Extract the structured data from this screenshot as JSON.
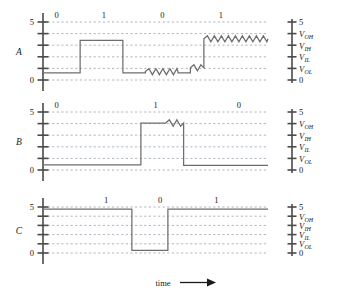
{
  "figure": {
    "caption_axis_label": "time",
    "time_arrow": "arrow-right"
  },
  "left_axis": {
    "top_label": "5",
    "bottom_label": "0",
    "tick_count": 6
  },
  "right_axis": {
    "labels": [
      {
        "text": "5",
        "type": "plain"
      },
      {
        "text": "V",
        "sub": "OH",
        "type": "voltage"
      },
      {
        "text": "V",
        "sub": "IH",
        "type": "voltage"
      },
      {
        "text": "V",
        "sub": "IL",
        "type": "voltage"
      },
      {
        "text": "V",
        "sub": "OL",
        "type": "voltage"
      },
      {
        "text": "0",
        "type": "plain"
      }
    ]
  },
  "rows": [
    {
      "name": "A",
      "label": "A",
      "description": "noisy signal with degraded levels",
      "bits": [
        "0",
        "1",
        "0",
        "1"
      ]
    },
    {
      "name": "B",
      "label": "B",
      "description": "partially restored signal",
      "bits": [
        "0",
        "1",
        "0"
      ]
    },
    {
      "name": "C",
      "label": "C",
      "description": "fully restored clean signal",
      "bits": [
        "1",
        "0",
        "1"
      ]
    }
  ],
  "chart_data": {
    "type": "line",
    "title": "",
    "xlabel": "time",
    "ylabel": "",
    "ylim": [
      0,
      5
    ],
    "grid": true,
    "legend": "none",
    "threshold_levels": [
      {
        "name": "5",
        "value": 5.0
      },
      {
        "name": "VOH",
        "value": 4.0
      },
      {
        "name": "VIH",
        "value": 3.0
      },
      {
        "name": "VIL",
        "value": 2.0
      },
      {
        "name": "VOL",
        "value": 1.0
      },
      {
        "name": "0",
        "value": 0.0
      }
    ],
    "series": [
      {
        "name": "A",
        "bit_labels": [
          "0",
          "1",
          "0",
          "1"
        ],
        "bit_label_x": [
          0.06,
          0.27,
          0.53,
          0.79
        ],
        "noise": "heavy",
        "segments": [
          {
            "bit": "0",
            "x0": 0.0,
            "x1": 0.165,
            "level": 0.62,
            "noise": "none"
          },
          {
            "bit": "1",
            "x0": 0.165,
            "x1": 0.355,
            "level": 3.42,
            "noise": "none"
          },
          {
            "bit": "0",
            "x0": 0.355,
            "x1": 0.455,
            "level": 0.62,
            "noise": "none"
          },
          {
            "bit": "0",
            "x0": 0.455,
            "x1": 0.6,
            "level": 0.72,
            "noise": "zigzag"
          },
          {
            "bit": "0",
            "x0": 0.6,
            "x1": 0.655,
            "level": 0.62,
            "noise": "none"
          },
          {
            "bit": "0",
            "x0": 0.655,
            "x1": 0.715,
            "level": 1.05,
            "noise": "zigzag"
          },
          {
            "bit": "1",
            "x0": 0.715,
            "x1": 1.0,
            "level": 3.55,
            "noise": "zigzag"
          }
        ]
      },
      {
        "name": "B",
        "bit_labels": [
          "0",
          "1",
          "0"
        ],
        "bit_label_x": [
          0.06,
          0.5,
          0.87
        ],
        "noise": "light",
        "segments": [
          {
            "bit": "0",
            "x0": 0.0,
            "x1": 0.435,
            "level": 0.45,
            "noise": "none"
          },
          {
            "bit": "1",
            "x0": 0.435,
            "x1": 0.545,
            "level": 4.05,
            "noise": "none"
          },
          {
            "bit": "1",
            "x0": 0.545,
            "x1": 0.625,
            "level": 4.05,
            "noise": "zigzag"
          },
          {
            "bit": "0",
            "x0": 0.625,
            "x1": 1.0,
            "level": 0.4,
            "noise": "none"
          }
        ]
      },
      {
        "name": "C",
        "bit_labels": [
          "1",
          "0",
          "1"
        ],
        "bit_label_x": [
          0.28,
          0.52,
          0.77
        ],
        "noise": "none",
        "segments": [
          {
            "bit": "1",
            "x0": 0.0,
            "x1": 0.395,
            "level": 4.78,
            "noise": "none"
          },
          {
            "bit": "0",
            "x0": 0.395,
            "x1": 0.555,
            "level": 0.28,
            "noise": "none"
          },
          {
            "bit": "1",
            "x0": 0.555,
            "x1": 1.0,
            "level": 4.78,
            "noise": "none"
          }
        ]
      }
    ]
  },
  "colors": {
    "wave": "#6e6e6e",
    "grid": "#9aa3b0",
    "axis": "#4a4a4a",
    "text": "#1a1a1a",
    "background": "#ffffff"
  }
}
